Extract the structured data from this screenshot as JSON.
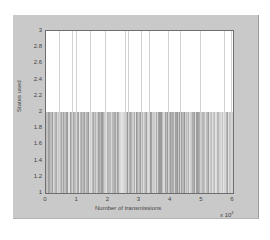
{
  "chart_data": {
    "type": "bar",
    "title": "",
    "xlabel": "Number of transmissions",
    "ylabel": "States used",
    "x_multiplier": "x 10",
    "x_multiplier_exp": "4",
    "xlim": [
      0,
      6
    ],
    "ylim": [
      1,
      3
    ],
    "xticks": [
      "0",
      "1",
      "2",
      "3",
      "4",
      "5",
      "6"
    ],
    "yticks": [
      "1",
      "1.2",
      "1.4",
      "1.6",
      "1.8",
      "2",
      "2.2",
      "2.4",
      "2.6",
      "2.8",
      "3"
    ],
    "grid": false,
    "legend": null,
    "series": [
      {
        "name": "states_used_2",
        "value": 2,
        "x_range": [
          0,
          6
        ],
        "density": "dense"
      },
      {
        "name": "states_used_3",
        "value": 3,
        "x": [
          0.42,
          0.85,
          0.95,
          1.4,
          1.9,
          2.55,
          2.62,
          3.05,
          3.3,
          3.9,
          4.3,
          4.95,
          5.7,
          5.95
        ]
      }
    ],
    "colors": {
      "stem": "#9a9a9a",
      "stem_tall": "#d2d2d2",
      "panel": "#c9c9c9",
      "axes_bg": "#ffffff"
    }
  }
}
